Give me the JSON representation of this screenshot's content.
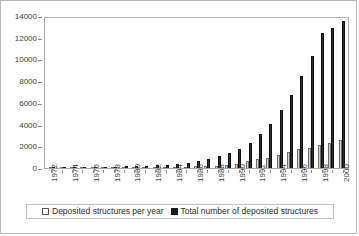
{
  "chart_data": {
    "type": "bar",
    "title": "",
    "subtitle": "",
    "xlabel": "",
    "ylabel": "",
    "ylim": [
      0,
      14000
    ],
    "y_ticks": [
      0,
      2000,
      4000,
      6000,
      8000,
      10000,
      12000,
      14000
    ],
    "grid": false,
    "legend_position": "bottom",
    "x_tick_label_rotation": 90,
    "x_tick_label_interval": 2,
    "categories": [
      "1972",
      "1973",
      "1974",
      "1975",
      "1976",
      "1977",
      "1978",
      "1979",
      "1980",
      "1981",
      "1982",
      "1983",
      "1984",
      "1985",
      "1986",
      "1987",
      "1988",
      "1989",
      "1990",
      "1991",
      "1992",
      "1993",
      "1994",
      "1995",
      "1996",
      "1997",
      "1998",
      "1999",
      "2000"
    ],
    "x_tick_labels": [
      "1972",
      "",
      "1974",
      "",
      "1976",
      "",
      "1978",
      "",
      "1980",
      "",
      "1982",
      "",
      "1984",
      "",
      "1986",
      "",
      "1988",
      "",
      "1990",
      "",
      "1992",
      "",
      "1994",
      "",
      "1996",
      "",
      "1998",
      "",
      "2000"
    ],
    "series": [
      {
        "name": "Deposited structures per year",
        "color": "#d2d2d2",
        "values": [
          8,
          9,
          13,
          16,
          23,
          24,
          22,
          28,
          31,
          39,
          56,
          49,
          71,
          116,
          167,
          198,
          205,
          276,
          385,
          614,
          800,
          944,
          1207,
          1465,
          1710,
          1878,
          2083,
          2321,
          2600
        ]
      },
      {
        "name": "Total number of deposited structures",
        "color": "#2b2b2b",
        "values": [
          8,
          17,
          30,
          46,
          69,
          93,
          115,
          143,
          174,
          213,
          269,
          318,
          389,
          505,
          672,
          870,
          1075,
          1351,
          1736,
          2350,
          3150,
          4094,
          5301,
          6766,
          8476,
          10354,
          12437,
          12900,
          13500
        ]
      }
    ]
  },
  "legend": {
    "entries": [
      {
        "label": "Deposited structures per year",
        "marker": "open-square"
      },
      {
        "label": "Total number of deposited structures",
        "marker": "filled-square"
      }
    ]
  }
}
